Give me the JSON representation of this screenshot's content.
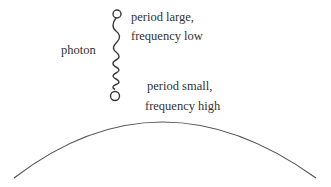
{
  "diagram": {
    "labels": {
      "photon": "photon",
      "top_line1": "period large,",
      "top_line2": "frequency low",
      "bottom_line1": "period small,",
      "bottom_line2": "frequency high"
    },
    "elements": {
      "photon": "wavy line (chirped wave) with circles at both ends, wavelength decreasing downward",
      "surface": "curved arc representing a surface (Earth/planet)"
    },
    "colors": {
      "line": "#3a3a3a",
      "text": "#333333",
      "background": "#ffffff"
    }
  }
}
